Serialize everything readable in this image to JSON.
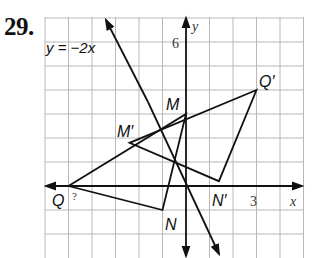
{
  "problem": {
    "number": "29."
  },
  "graph": {
    "origin_px": [
      186,
      186
    ],
    "unit_px": {
      "x": 23.5,
      "y": 24
    },
    "grid_range": {
      "x": [
        -6,
        5
      ],
      "y": [
        -3,
        7
      ]
    },
    "axes": {
      "x_label": "x",
      "y_label": "y",
      "x_tick_label": "3",
      "y_tick_label": "6"
    },
    "line_label": "y = −2x",
    "triangle_original": {
      "vertices": [
        {
          "name": "Q",
          "label": "Q",
          "x": -5,
          "y": 0
        },
        {
          "name": "M",
          "label": "M",
          "x": 0,
          "y": 3
        },
        {
          "name": "N",
          "label": "N",
          "x": -1,
          "y": -1
        }
      ]
    },
    "triangle_image": {
      "vertices": [
        {
          "name": "Q'",
          "label": "Q′",
          "x": 3,
          "y": 4
        },
        {
          "name": "M'",
          "label": "M′",
          "x": -2.4,
          "y": 1.8
        },
        {
          "name": "N'",
          "label": "N′",
          "x": 1.4,
          "y": 0.2
        }
      ]
    },
    "annotation": "?",
    "colors": {
      "grid": "#b8b8b8",
      "ink": "#111111"
    }
  }
}
